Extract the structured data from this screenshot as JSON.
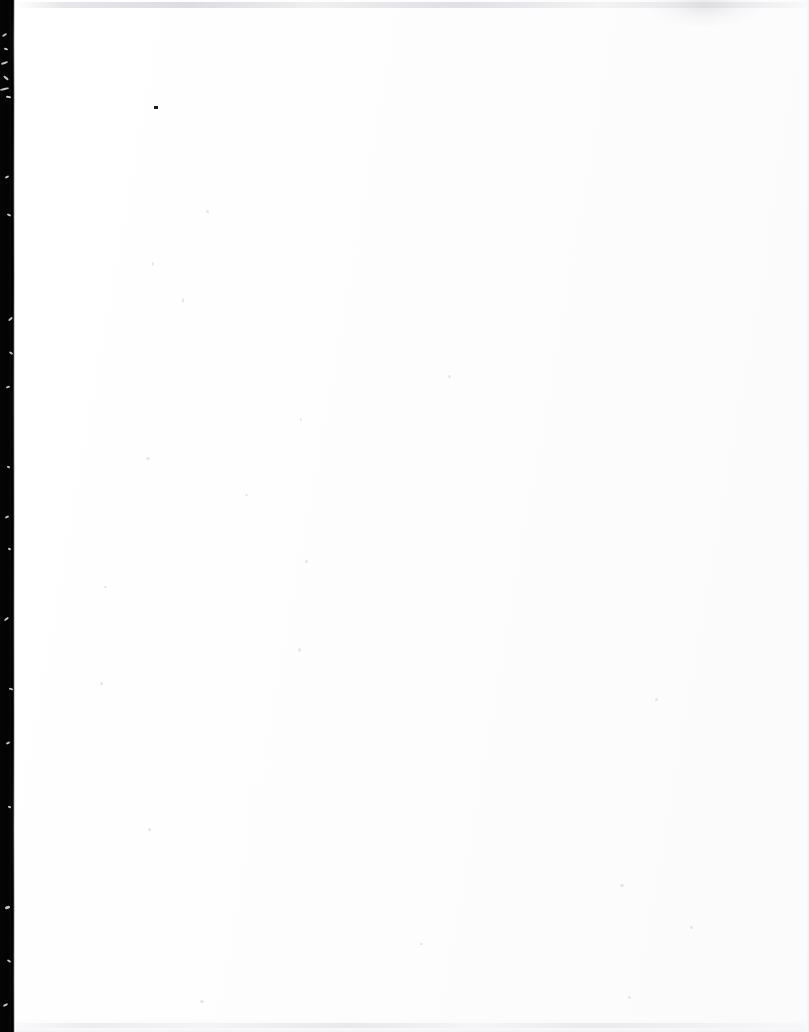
{
  "page": {
    "kind": "blank-scanned-page",
    "label": "Blank page",
    "width": 809,
    "height": 1032,
    "background_color": "#ffffff",
    "paper_color": "#fdfdfe",
    "visible_text": "",
    "text_content_note": "No text, headings, figures, captions, page numbers or marginalia are rendered anywhere on this page."
  },
  "artifacts": {
    "gutter": {
      "name": "binding-gutter-shadow",
      "side": "left",
      "color": "#020202",
      "edge_color": "#9a9a9a",
      "x_start": 0,
      "x_end": 14
    },
    "scanner_streak_top": {
      "name": "scanner-streak-top",
      "color": "#d6d6dc",
      "y": 2,
      "height": 6
    },
    "scanner_streak_bottom": {
      "name": "scanner-streak-bottom",
      "color": "#e2e2e7",
      "y": 1023,
      "height": 5
    },
    "right_edge": {
      "name": "page-right-edge",
      "color": "#ececf0"
    },
    "ink_speck": {
      "name": "ink-speck",
      "color": "#1b1b1b",
      "x": 154,
      "y": 106,
      "width": 4,
      "height": 3
    },
    "scratches": [
      {
        "x": 2,
        "y": 34,
        "w": 5,
        "h": 2,
        "rot": -34
      },
      {
        "x": 4,
        "y": 48,
        "w": 4,
        "h": 2,
        "rot": 22
      },
      {
        "x": 1,
        "y": 62,
        "w": 7,
        "h": 2,
        "rot": -18
      },
      {
        "x": 3,
        "y": 77,
        "w": 6,
        "h": 2,
        "rot": 40
      },
      {
        "x": 0,
        "y": 88,
        "w": 9,
        "h": 2,
        "rot": -12
      },
      {
        "x": 6,
        "y": 96,
        "w": 5,
        "h": 2,
        "rot": 8
      },
      {
        "x": 5,
        "y": 176,
        "w": 4,
        "h": 2,
        "rot": -30
      },
      {
        "x": 7,
        "y": 214,
        "w": 4,
        "h": 2,
        "rot": 25
      },
      {
        "x": 8,
        "y": 318,
        "w": 5,
        "h": 2,
        "rot": -42
      },
      {
        "x": 9,
        "y": 352,
        "w": 4,
        "h": 2,
        "rot": 36
      },
      {
        "x": 6,
        "y": 386,
        "w": 4,
        "h": 2,
        "rot": -20
      },
      {
        "x": 7,
        "y": 466,
        "w": 3,
        "h": 2,
        "rot": 18
      },
      {
        "x": 5,
        "y": 516,
        "w": 4,
        "h": 2,
        "rot": -26
      },
      {
        "x": 8,
        "y": 548,
        "w": 3,
        "h": 2,
        "rot": 30
      },
      {
        "x": 4,
        "y": 618,
        "w": 5,
        "h": 2,
        "rot": -38
      },
      {
        "x": 9,
        "y": 688,
        "w": 4,
        "h": 2,
        "rot": 14
      },
      {
        "x": 6,
        "y": 742,
        "w": 4,
        "h": 2,
        "rot": -24
      },
      {
        "x": 8,
        "y": 806,
        "w": 3,
        "h": 2,
        "rot": 28
      },
      {
        "x": 5,
        "y": 906,
        "w": 5,
        "h": 3,
        "rot": -16
      },
      {
        "x": 7,
        "y": 960,
        "w": 4,
        "h": 2,
        "rot": 34
      },
      {
        "x": 3,
        "y": 1004,
        "w": 5,
        "h": 2,
        "rot": -28
      }
    ],
    "faint_specks": [
      {
        "x": 206,
        "y": 210,
        "w": 3,
        "h": 3
      },
      {
        "x": 152,
        "y": 262,
        "w": 2,
        "h": 4
      },
      {
        "x": 182,
        "y": 298,
        "w": 2,
        "h": 5
      },
      {
        "x": 448,
        "y": 375,
        "w": 3,
        "h": 3
      },
      {
        "x": 300,
        "y": 418,
        "w": 2,
        "h": 3
      },
      {
        "x": 146,
        "y": 457,
        "w": 4,
        "h": 3
      },
      {
        "x": 245,
        "y": 494,
        "w": 3,
        "h": 2
      },
      {
        "x": 305,
        "y": 560,
        "w": 3,
        "h": 3
      },
      {
        "x": 104,
        "y": 586,
        "w": 3,
        "h": 2
      },
      {
        "x": 298,
        "y": 648,
        "w": 3,
        "h": 4
      },
      {
        "x": 100,
        "y": 682,
        "w": 3,
        "h": 3
      },
      {
        "x": 655,
        "y": 698,
        "w": 3,
        "h": 3
      },
      {
        "x": 148,
        "y": 828,
        "w": 3,
        "h": 3
      },
      {
        "x": 620,
        "y": 884,
        "w": 4,
        "h": 3
      },
      {
        "x": 690,
        "y": 926,
        "w": 3,
        "h": 3
      },
      {
        "x": 420,
        "y": 943,
        "w": 3,
        "h": 2
      },
      {
        "x": 628,
        "y": 996,
        "w": 3,
        "h": 3
      },
      {
        "x": 200,
        "y": 1000,
        "w": 4,
        "h": 3
      }
    ]
  }
}
